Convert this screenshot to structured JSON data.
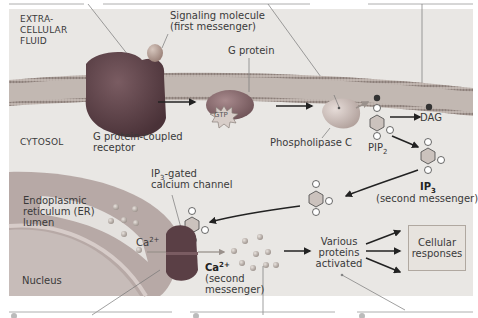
{
  "diagram": {
    "regions": {
      "extracellular": "EXTRA-\nCELLULAR\nFLUID",
      "extracellular_lines": [
        "EXTRA-",
        "CELLULAR",
        "FLUID"
      ],
      "cytosol": "CYTOSOL",
      "er_lumen_lines": [
        "Endoplasmic",
        "reticulum (ER)",
        "lumen"
      ],
      "nucleus": "Nucleus"
    },
    "labels": {
      "signaling_molecule_line1": "Signaling molecule",
      "signaling_molecule_line2": "(first messenger)",
      "g_protein": "G protein",
      "gtp": "GTP",
      "gpcr_line1": "G protein-coupled",
      "gpcr_line2": "receptor",
      "phospholipase_c": "Phospholipase C",
      "pip2_base": "PIP",
      "pip2_sub": "2",
      "dag": "DAG",
      "ip3_base": "IP",
      "ip3_sub": "3",
      "ip3_desc": "(second messenger)",
      "ip3_gated_base": "IP",
      "ip3_gated_sub": "3",
      "ip3_gated_rest": "-gated",
      "calcium_channel": "calcium channel",
      "ca_er_base": "Ca",
      "ca_er_sup": "2+",
      "ca_cyto_base": "Ca",
      "ca_cyto_sup": "2+",
      "ca_cyto_desc1": "(second",
      "ca_cyto_desc2": "messenger)",
      "various_line1": "Various",
      "various_line2": "proteins",
      "various_line3": "activated",
      "cellular_line1": "Cellular",
      "cellular_line2": "responses"
    },
    "colors": {
      "background": "#e9e7e4",
      "membrane": "#b9aea8",
      "membrane_heads": "#8d807a",
      "receptor": "#5c4248",
      "signal_molecule": "#b79f94",
      "g_protein": "#8b6b6f",
      "phospholipase": "#cdbfba",
      "er": "#b7a9a6",
      "nucleus": "#c7bcb9",
      "channel": "#5a3f45",
      "calcium": "#b8b0aa",
      "arrow": "#222222",
      "text": "#3a3a3a"
    }
  }
}
